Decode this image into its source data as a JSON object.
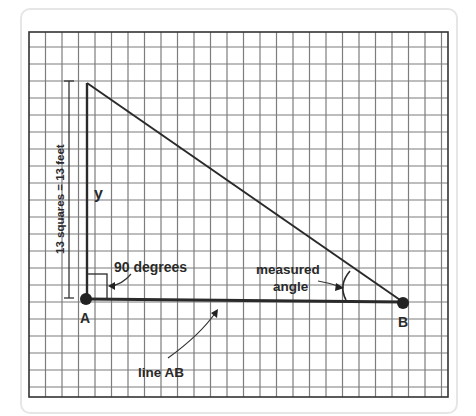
{
  "diagram": {
    "grid": {
      "columns": 25,
      "rows": 22,
      "line_color": "#7a7a7a",
      "border_color": "#333333"
    },
    "labels": {
      "point_a": "A",
      "point_b": "B",
      "side_y": "y",
      "right_angle": "90 degrees",
      "measured_angle_line1": "measured",
      "measured_angle_line2": "angle",
      "line_ab": "line AB",
      "scale": "13 squares = 13 feet"
    },
    "colors": {
      "ink": "#2a2a2a",
      "background": "#ffffff"
    }
  }
}
